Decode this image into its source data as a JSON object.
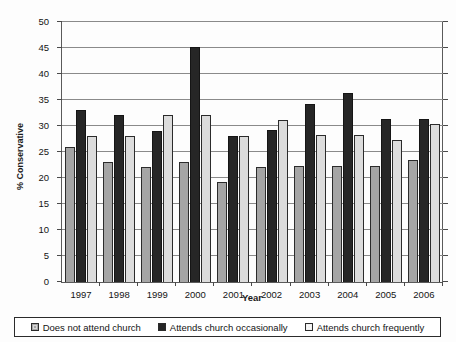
{
  "chart_data": {
    "type": "bar",
    "title": "",
    "xlabel": "Year",
    "ylabel": "% Conservative",
    "categories": [
      "1997",
      "1998",
      "1999",
      "2000",
      "2001",
      "2002",
      "2003",
      "2004",
      "2005",
      "2006"
    ],
    "ylim": [
      0,
      50
    ],
    "ytick_labels": [
      "0",
      "5",
      "10",
      "15",
      "20",
      "25",
      "30",
      "35",
      "40",
      "45",
      "50"
    ],
    "ytick_values": [
      0,
      5,
      10,
      15,
      20,
      25,
      30,
      35,
      40,
      45,
      50
    ],
    "grid": true,
    "legend_position": "bottom",
    "series": [
      {
        "name": "Does not attend church",
        "color": "#a5a5a5",
        "values": [
          26.0,
          23.0,
          22.1,
          23.1,
          19.2,
          22.2,
          22.3,
          22.3,
          22.4,
          23.4
        ]
      },
      {
        "name": "Attends church occasionally",
        "color": "#262626",
        "values": [
          33.0,
          32.2,
          29.1,
          45.2,
          28.1,
          29.2,
          34.2,
          36.4,
          31.3,
          31.3
        ]
      },
      {
        "name": "Attends church frequently",
        "color": "#dcdcdc",
        "values": [
          28.0,
          28.0,
          32.1,
          32.2,
          28.1,
          31.2,
          28.2,
          28.3,
          27.3,
          30.3
        ]
      }
    ]
  },
  "axis": {
    "y_title": "% Conservative",
    "x_title": "Year"
  },
  "legend": {
    "items": [
      {
        "label": "Does not attend church",
        "swatch": "legend-swatch-light-gray"
      },
      {
        "label": "Attends church occasionally",
        "swatch": "legend-swatch-black"
      },
      {
        "label": "Attends church frequently",
        "swatch": "legend-swatch-white"
      }
    ]
  }
}
